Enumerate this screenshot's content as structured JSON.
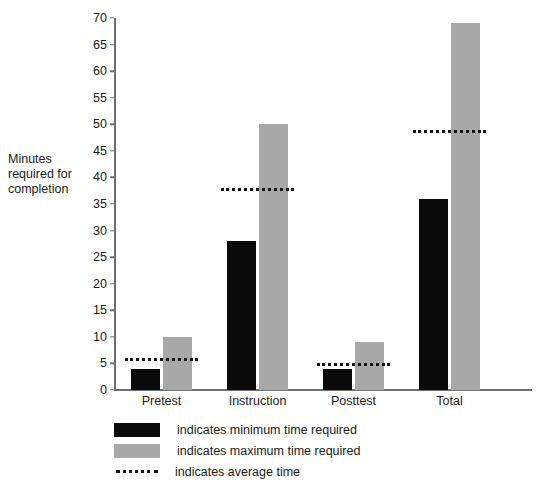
{
  "chart_data": {
    "type": "bar",
    "title": "",
    "xlabel": "",
    "ylabel": "Minutes\nrequired for\ncompletion",
    "ylim": [
      0,
      70
    ],
    "ytick_step": 5,
    "yticks": [
      0,
      5,
      10,
      15,
      20,
      25,
      30,
      35,
      40,
      45,
      50,
      55,
      60,
      65,
      70
    ],
    "categories": [
      "Pretest",
      "Instruction",
      "Posttest",
      "Total"
    ],
    "grid": false,
    "legend_position": "bottom-left",
    "series": [
      {
        "name": "indicates minimum time required",
        "key": "minimum",
        "color": "#0a0a0a",
        "values": [
          4,
          28,
          4,
          36
        ]
      },
      {
        "name": "indicates maximum time required",
        "key": "maximum",
        "color": "#a8a8a8",
        "values": [
          10,
          50,
          9,
          69
        ]
      },
      {
        "name": "indicates average time",
        "key": "average",
        "color": "#141414",
        "style": "dotted-line",
        "values": [
          6,
          38,
          5,
          49
        ]
      }
    ]
  },
  "legend": {
    "items": [
      {
        "label": "indicates minimum time required",
        "swatch": "min"
      },
      {
        "label": "indicates maximum time required",
        "swatch": "max"
      },
      {
        "label": "indicates average time",
        "swatch": "avg"
      }
    ]
  }
}
